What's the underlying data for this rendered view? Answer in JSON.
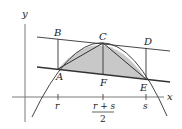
{
  "diagram": {
    "type": "geometry-parabola-inscribed-triangle",
    "colors": {
      "axis": "#7a7a7a",
      "lines": "#333333",
      "fill": "#c8c8c8",
      "parabola": "#444444",
      "background": "#ffffff"
    },
    "axes": {
      "x_label": "x",
      "y_label": "y"
    },
    "points": {
      "A": "A",
      "B": "B",
      "C": "C",
      "D": "D",
      "E": "E",
      "F": "F"
    },
    "ticks": {
      "r": "r",
      "mid_numerator": "r + s",
      "mid_denominator": "2",
      "s": "s"
    }
  }
}
